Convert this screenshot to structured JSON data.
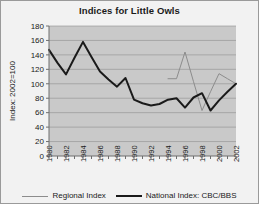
{
  "chart_data": {
    "type": "line",
    "title": "Indices for Little Owls",
    "xlabel": "",
    "ylabel": "Index: 2002=100",
    "ylim": [
      0,
      180
    ],
    "ytick_step": 20,
    "yticks": [
      "0",
      "20",
      "40",
      "60",
      "80",
      "100",
      "120",
      "140",
      "160",
      "180"
    ],
    "xlim": [
      1980,
      2002
    ],
    "xticks": [
      "1980",
      "1982",
      "1984",
      "1986",
      "1988",
      "1990",
      "1992",
      "1994",
      "1996",
      "1998",
      "2000",
      "2002"
    ],
    "x": [
      1980,
      1981,
      1982,
      1983,
      1984,
      1985,
      1986,
      1987,
      1988,
      1989,
      1990,
      1991,
      1992,
      1993,
      1994,
      1995,
      1996,
      1997,
      1998,
      1999,
      2000,
      2001,
      2002
    ],
    "grid": true,
    "legend_position": "bottom",
    "series": [
      {
        "name": "Regional Index",
        "color": "#8c8c8c",
        "width": 1,
        "x": [
          1994,
          1995,
          1996,
          1997,
          1998,
          1999,
          2000,
          2001,
          2002
        ],
        "values": [
          107,
          107,
          144,
          103,
          63,
          89,
          114,
          107,
          100
        ]
      },
      {
        "name": "National Index: CBC/BBS",
        "color": "#1a1a1a",
        "width": 2,
        "x": [
          1980,
          1981,
          1982,
          1983,
          1984,
          1985,
          1986,
          1987,
          1988,
          1989,
          1990,
          1991,
          1992,
          1993,
          1994,
          1995,
          1996,
          1997,
          1998,
          1999,
          2000,
          2001,
          2002
        ],
        "values": [
          147,
          129,
          113,
          136,
          158,
          137,
          117,
          106,
          96,
          108,
          78,
          73,
          70,
          72,
          78,
          80,
          67,
          81,
          87,
          63,
          77,
          89,
          100
        ]
      }
    ]
  },
  "legend": {
    "items": [
      {
        "label": "Regional Index"
      },
      {
        "label": "National Index: CBC/BBS"
      }
    ]
  }
}
